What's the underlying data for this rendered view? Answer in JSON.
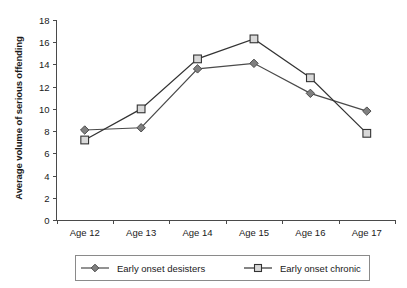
{
  "chart_data": {
    "type": "line",
    "title": "",
    "xlabel": "",
    "ylabel": "Average volume of serious offending",
    "categories": [
      "Age 12",
      "Age 13",
      "Age 14",
      "Age 15",
      "Age 16",
      "Age 17"
    ],
    "ylim": [
      0,
      18
    ],
    "ytick_step": 2,
    "yticks": [
      "0",
      "2",
      "4",
      "6",
      "8",
      "10",
      "12",
      "14",
      "16",
      "18"
    ],
    "grid": false,
    "legend_position": "bottom",
    "series": [
      {
        "name": "Early onset desisters",
        "marker": "filled-diamond",
        "color": "#4a4a4a",
        "marker_fill": "#808080",
        "values": [
          8.1,
          8.3,
          13.6,
          14.1,
          11.4,
          9.8
        ]
      },
      {
        "name": "Early onset chronic",
        "marker": "open-square",
        "color": "#333333",
        "marker_fill": "#d9d9d9",
        "values": [
          7.2,
          10.0,
          14.5,
          16.3,
          12.8,
          7.8
        ]
      }
    ]
  },
  "legend": {
    "items": [
      {
        "label": "Early onset desisters",
        "marker": "filled-diamond"
      },
      {
        "label": "Early onset chronic",
        "marker": "open-square"
      }
    ]
  },
  "colors": {
    "axis": "#4a4a4a",
    "series_1": "#4a4a4a",
    "series_2": "#333333",
    "legend_border": "#8a8a8a",
    "background": "#ffffff"
  }
}
